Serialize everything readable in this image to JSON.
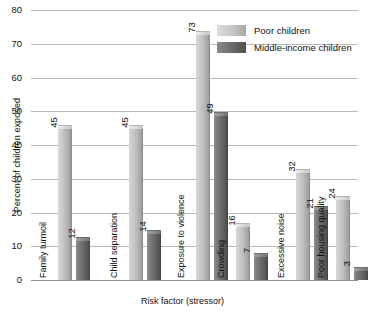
{
  "chart_data": {
    "type": "bar",
    "title": "",
    "xlabel": "Risk factor (stressor)",
    "ylabel": "Percent of children exposed",
    "ylim": [
      0,
      80
    ],
    "yticks": [
      0,
      10,
      20,
      30,
      40,
      50,
      60,
      70,
      80
    ],
    "grid": true,
    "legend_position": "top-right",
    "categories": [
      "Family turmoil",
      "Child separation",
      "Exposure to violence",
      "Crowding",
      "Excessive noise",
      "Poor housing quality"
    ],
    "series": [
      {
        "name": "Poor children",
        "color": "#c0c0c0",
        "values": [
          45,
          45,
          73,
          16,
          32,
          24
        ]
      },
      {
        "name": "Middle-income children",
        "color": "#616161",
        "values": [
          12,
          14,
          49,
          7,
          21,
          3
        ]
      }
    ]
  },
  "legend": {
    "items": [
      {
        "label": "Poor children",
        "swatch": "light"
      },
      {
        "label": "Middle-income children",
        "swatch": "dark"
      }
    ]
  }
}
